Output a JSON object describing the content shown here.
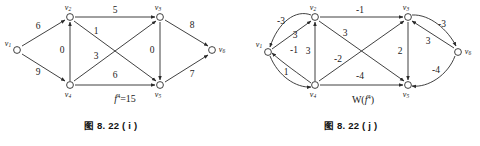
{
  "figure": {
    "left": {
      "caption": "图 8. 22 ( i )",
      "flow_label": "f 4 =15",
      "flow_label_parts": {
        "symbol": "f",
        "superscript": "4",
        "rest": "=15"
      },
      "nodes": [
        {
          "id": "v1",
          "label": "v",
          "sub": "1",
          "x": 17,
          "y": 50
        },
        {
          "id": "v2",
          "label": "v",
          "sub": "2",
          "x": 70,
          "y": 17
        },
        {
          "id": "v3",
          "label": "v",
          "sub": "3",
          "x": 160,
          "y": 17
        },
        {
          "id": "v4",
          "label": "v",
          "sub": "4",
          "x": 70,
          "y": 85
        },
        {
          "id": "v5",
          "label": "v",
          "sub": "5",
          "x": 160,
          "y": 85
        },
        {
          "id": "v6",
          "label": "v",
          "sub": "6",
          "x": 212,
          "y": 50
        }
      ],
      "edges": [
        {
          "from": "v1",
          "to": "v2",
          "weight": "6",
          "lx": 38,
          "ly": 27
        },
        {
          "from": "v1",
          "to": "v4",
          "weight": "9",
          "lx": 38,
          "ly": 73
        },
        {
          "from": "v4",
          "to": "v2",
          "weight": "0",
          "lx": 62,
          "ly": 51
        },
        {
          "from": "v2",
          "to": "v3",
          "weight": "5",
          "lx": 115,
          "ly": 11
        },
        {
          "from": "v2",
          "to": "v5",
          "weight": "1",
          "lx": 96,
          "ly": 32
        },
        {
          "from": "v4",
          "to": "v3",
          "weight": "3",
          "lx": 96,
          "ly": 57
        },
        {
          "from": "v4",
          "to": "v5",
          "weight": "6",
          "lx": 115,
          "ly": 76
        },
        {
          "from": "v3",
          "to": "v5",
          "weight": "0",
          "lx": 152,
          "ly": 51
        },
        {
          "from": "v3",
          "to": "v6",
          "weight": "8",
          "lx": 192,
          "ly": 26
        },
        {
          "from": "v5",
          "to": "v6",
          "weight": "7",
          "lx": 192,
          "ly": 75
        }
      ]
    },
    "right": {
      "caption": "图 8. 22 ( j )",
      "flow_label": "W( f 4 )",
      "flow_label_parts": {
        "prefix": "W(",
        "symbol": "f",
        "superscript": "4",
        "suffix": ")"
      },
      "nodes": [
        {
          "id": "v1",
          "label": "v",
          "sub": "1",
          "x": 268,
          "y": 52
        },
        {
          "id": "v2",
          "label": "v",
          "sub": "2",
          "x": 315,
          "y": 17
        },
        {
          "id": "v3",
          "label": "v",
          "sub": "3",
          "x": 408,
          "y": 17
        },
        {
          "id": "v4",
          "label": "v",
          "sub": "4",
          "x": 315,
          "y": 85
        },
        {
          "id": "v5",
          "label": "v",
          "sub": "5",
          "x": 408,
          "y": 85
        },
        {
          "id": "v6",
          "label": "v",
          "sub": "6",
          "x": 458,
          "y": 52
        }
      ],
      "edges": [
        {
          "from": "v2",
          "to": "v1",
          "weight": "-3",
          "lx": 281,
          "ly": 22,
          "curved": true
        },
        {
          "from": "v1",
          "to": "v2",
          "weight": "3",
          "lx": 295,
          "ly": 36
        },
        {
          "from": "v4",
          "to": "v1",
          "weight": "-1",
          "lx": 294,
          "ly": 51,
          "curved": true
        },
        {
          "from": "v1",
          "to": "v4",
          "weight": "1",
          "lx": 286,
          "ly": 73,
          "curved": true
        },
        {
          "from": "v4",
          "to": "v2",
          "weight": "3",
          "lx": 308,
          "ly": 52
        },
        {
          "from": "v2",
          "to": "v3",
          "weight": "-1",
          "lx": 360,
          "ly": 11
        },
        {
          "from": "v2",
          "to": "v5",
          "weight": "-2",
          "lx": 338,
          "ly": 60
        },
        {
          "from": "v4",
          "to": "v3",
          "weight": "3",
          "lx": 345,
          "ly": 34
        },
        {
          "from": "v4",
          "to": "v5",
          "weight": "-4",
          "lx": 360,
          "ly": 77
        },
        {
          "from": "v3",
          "to": "v5",
          "weight": "2",
          "lx": 400,
          "ly": 52
        },
        {
          "from": "v3",
          "to": "v6",
          "weight": "-3",
          "lx": 442,
          "ly": 25,
          "curved": true
        },
        {
          "from": "v6",
          "to": "v3",
          "weight": "3",
          "lx": 428,
          "ly": 42
        },
        {
          "from": "v6",
          "to": "v5",
          "weight": "-4",
          "lx": 436,
          "ly": 71,
          "curved": true
        }
      ]
    }
  }
}
